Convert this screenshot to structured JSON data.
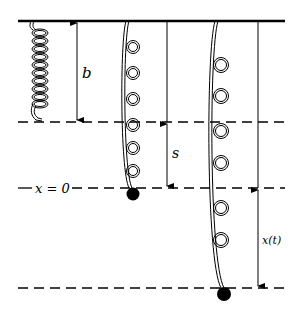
{
  "diagram": {
    "type": "spring-mass system",
    "labels": {
      "b": "b",
      "s": "s",
      "x_zero": "x = 0",
      "x_t": "x(t)"
    },
    "colors": {
      "line": "#000000",
      "background": "#ffffff"
    },
    "springs": [
      {
        "name": "unstretched spring",
        "mass": false
      },
      {
        "name": "spring at equilibrium",
        "mass": true
      },
      {
        "name": "spring in motion",
        "mass": true
      }
    ]
  }
}
